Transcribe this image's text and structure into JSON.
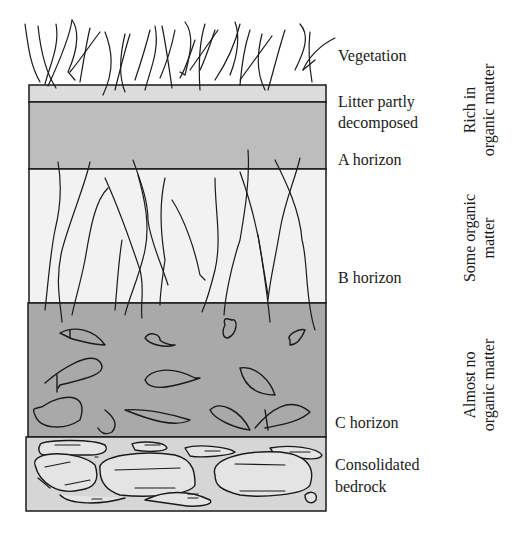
{
  "diagram": {
    "colors": {
      "litter": "#dcdcdc",
      "a_horizon": "#bdbdbd",
      "b_horizon": "#f2f2f2",
      "c_horizon": "#a9a9a9",
      "bedrock": "#d6d6d6",
      "line": "#1a1a1a"
    },
    "layers": [
      {
        "id": "vegetation",
        "label": "Vegetation"
      },
      {
        "id": "litter",
        "label_line1": "Litter partly",
        "label_line2": "decomposed"
      },
      {
        "id": "a_horizon",
        "label": "A horizon"
      },
      {
        "id": "b_horizon",
        "label": "B horizon"
      },
      {
        "id": "c_horizon",
        "label": "C horizon"
      },
      {
        "id": "bedrock",
        "label_line1": "Consolidated",
        "label_line2": "bedrock"
      }
    ],
    "organic_matter": [
      {
        "line1": "Rich in",
        "line2": "organic matter"
      },
      {
        "line1": "Some organic",
        "line2": "matter"
      },
      {
        "line1": "Almost no",
        "line2": "organic matter"
      }
    ]
  }
}
